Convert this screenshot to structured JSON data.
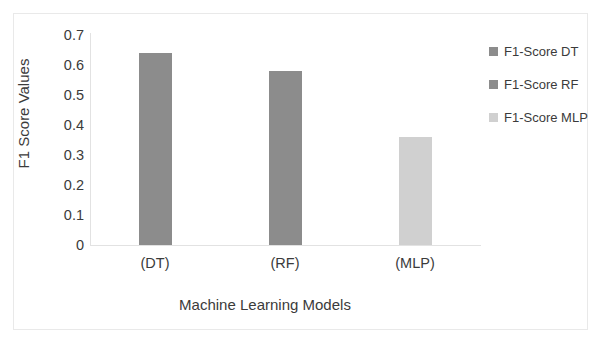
{
  "chart_data": {
    "type": "bar",
    "title": "",
    "categories": [
      "(DT)",
      "(RF)",
      "(MLP)"
    ],
    "series": [
      {
        "name": "F1-Score DT",
        "values": [
          0.64,
          null,
          null
        ],
        "color": "#8c8c8c"
      },
      {
        "name": "F1-Score RF",
        "values": [
          null,
          0.58,
          null
        ],
        "color": "#8c8c8c"
      },
      {
        "name": "F1-Score MLP",
        "values": [
          null,
          null,
          0.36
        ],
        "color": "#d0d0d0"
      }
    ],
    "values": [
      0.64,
      0.58,
      0.36
    ],
    "bar_colors": [
      "#8c8c8c",
      "#8c8c8c",
      "#d0d0d0"
    ],
    "xlabel": "Machine Learning Models",
    "ylabel": "F1 Score Values",
    "ylim": [
      0,
      0.7
    ],
    "ytick_step": 0.1,
    "ytick_labels": [
      "0.7",
      "0.6",
      "0.5",
      "0.4",
      "0.3",
      "0.2",
      "0.1",
      "0"
    ],
    "ytick_values": [
      0.7,
      0.6,
      0.5,
      0.4,
      0.3,
      0.2,
      0.1,
      0
    ],
    "grid": false,
    "legend_position": "right"
  },
  "legend": {
    "items": [
      {
        "label": "F1-Score DT",
        "color": "#8c8c8c"
      },
      {
        "label": "F1-Score RF",
        "color": "#8c8c8c"
      },
      {
        "label": "F1-Score MLP",
        "color": "#d0d0d0"
      }
    ]
  },
  "axes": {
    "x_title": "Machine Learning Models",
    "y_title": "F1 Score Values"
  }
}
